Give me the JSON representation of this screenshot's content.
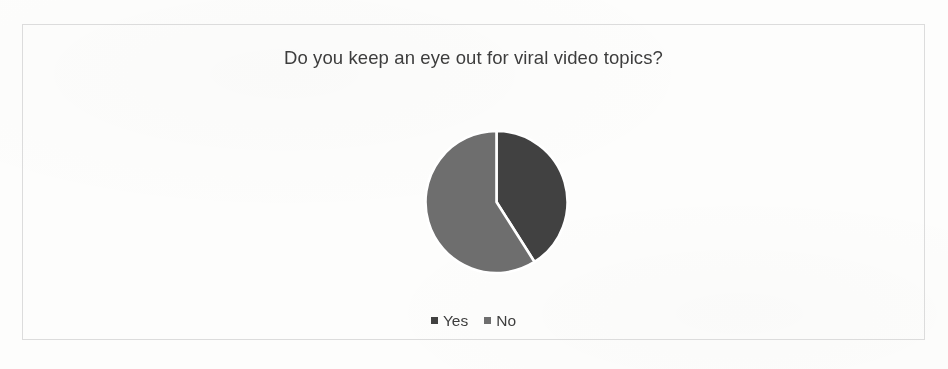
{
  "chart_data": {
    "type": "pie",
    "title": "Do you keep an eye out for viral video topics?",
    "categories": [
      "Yes",
      "No"
    ],
    "values": [
      41,
      59
    ],
    "value_unit": "percent",
    "colors": [
      "#414141",
      "#6e6e6e"
    ],
    "legend_position": "bottom",
    "start_angle_deg": 0,
    "direction": "clockwise",
    "grid": false,
    "xlabel": "",
    "ylabel": "",
    "slices": [
      {
        "label": "Yes",
        "value": 41,
        "color": "#414141",
        "start_deg": 0,
        "end_deg": 147
      },
      {
        "label": "No",
        "value": 59,
        "color": "#6e6e6e",
        "start_deg": 147,
        "end_deg": 360
      }
    ]
  },
  "legend": {
    "items": [
      {
        "label": "Yes",
        "color": "#414141"
      },
      {
        "label": "No",
        "color": "#6e6e6e"
      }
    ]
  },
  "frame": {
    "border_color": "#dcdcdc",
    "background": "#ffffff"
  }
}
